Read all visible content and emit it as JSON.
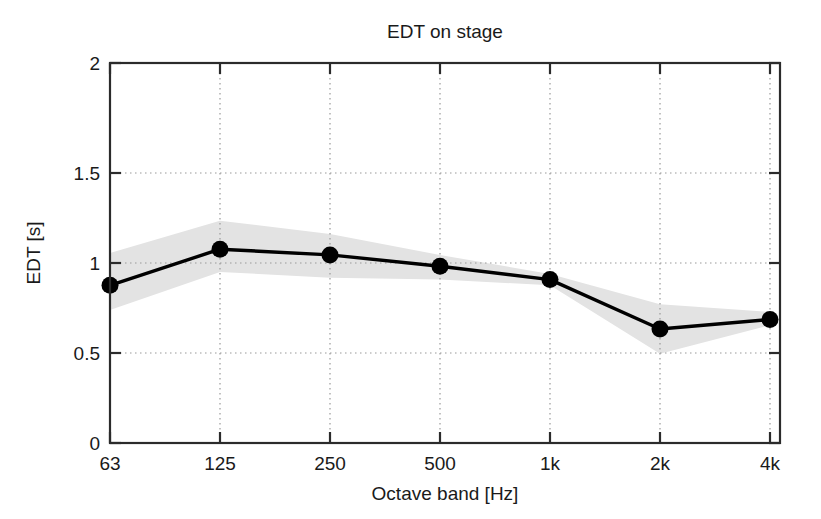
{
  "chart_data": {
    "type": "line",
    "title": "EDT on stage",
    "xlabel": "Octave band [Hz]",
    "ylabel": "EDT [s]",
    "categories": [
      "63",
      "125",
      "250",
      "500",
      "1k",
      "2k",
      "4k"
    ],
    "x": [
      1,
      2,
      3,
      4,
      5,
      6,
      7
    ],
    "values": [
      0.83,
      1.02,
      0.99,
      0.93,
      0.86,
      0.6,
      0.65
    ],
    "series": [
      {
        "name": "EDT mean",
        "values": [
          0.83,
          1.02,
          0.99,
          0.93,
          0.86,
          0.6,
          0.65
        ],
        "marker": "filled-circle",
        "color": "#000000"
      },
      {
        "name": "EDT spread band upper",
        "values": [
          1.0,
          1.17,
          1.1,
          0.99,
          0.89,
          0.73,
          0.69
        ],
        "color": "#e3e3e3"
      },
      {
        "name": "EDT spread band lower",
        "values": [
          0.7,
          0.9,
          0.87,
          0.86,
          0.83,
          0.47,
          0.62
        ],
        "color": "#e3e3e3"
      }
    ],
    "ylim": [
      0,
      2
    ],
    "yticks": [
      "0",
      "0.5",
      "1",
      "1.5",
      "2"
    ],
    "ytick_values": [
      0,
      0.5,
      1,
      1.5,
      2
    ],
    "xticks": [
      "63",
      "125",
      "250",
      "500",
      "1k",
      "2k",
      "4k"
    ],
    "grid": "dotted",
    "grid_color": "#b0b0b0",
    "legend": "none",
    "band_color": "#e3e3e3",
    "line_color": "#000000",
    "axis_color": "#2b2b2b",
    "background": "#ffffff"
  }
}
